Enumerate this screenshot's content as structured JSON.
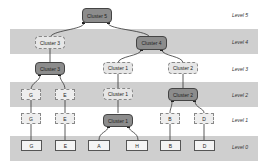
{
  "levels": [
    {
      "label": "Level 5"
    },
    {
      "label": "Level 4"
    },
    {
      "label": "Level 3"
    },
    {
      "label": "Level 2"
    },
    {
      "label": "Level 1"
    },
    {
      "label": "Level 0"
    }
  ],
  "nodes": {
    "cluster5_l5": "Cluster 5",
    "cluster3_l4": "Cluster 3",
    "cluster4_l4": "Cluster 4",
    "cluster3_l3": "Cluster 3",
    "cluster1_l3": "Cluster 1",
    "cluster2_l3": "Cluster 2",
    "g_l2": "G",
    "e_l2": "E",
    "cluster1_l2": "Cluster 1",
    "cluster2_l2": "Cluster 2",
    "g_l1": "G",
    "e_l1": "E",
    "cluster1_l1": "Cluster 1",
    "b_l1": "B",
    "d_l1": "D",
    "g_l0": "G",
    "e_l0": "E",
    "a_l0": "A",
    "h_l0": "H",
    "b_l0": "B",
    "d_l0": "D"
  },
  "colors": {
    "band": "#cfcfcf",
    "cluster_active": "#8c8c8c",
    "cluster_inactive": "#e6e6e6"
  }
}
